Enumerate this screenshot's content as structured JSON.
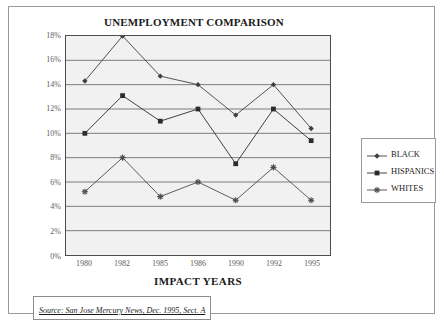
{
  "chart_data": {
    "type": "line",
    "title": "UNEMPLOYMENT COMPARISON",
    "xlabel": "IMPACT YEARS",
    "ylabel": "",
    "categories": [
      "1980",
      "1982",
      "1985",
      "1986",
      "1990",
      "1992",
      "1995"
    ],
    "ylim": [
      0,
      18
    ],
    "ytick_labels": [
      "0%",
      "2%",
      "4%",
      "6%",
      "8%",
      "10%",
      "12%",
      "14%",
      "16%",
      "18%"
    ],
    "ytick_values": [
      0,
      2,
      4,
      6,
      8,
      10,
      12,
      14,
      16,
      18
    ],
    "grid": "horizontal",
    "legend_position": "right",
    "series": [
      {
        "name": "BLACK",
        "marker": "diamond",
        "color": "#3f3f3f",
        "values": [
          14.3,
          18.0,
          14.7,
          14.0,
          11.5,
          14.0,
          10.4
        ]
      },
      {
        "name": "HISPANICS",
        "marker": "square",
        "color": "#2b2b2b",
        "values": [
          10.0,
          13.1,
          11.0,
          12.0,
          7.5,
          12.0,
          9.4
        ]
      },
      {
        "name": "WHITES",
        "marker": "star",
        "color": "#4a4a4a",
        "values": [
          5.2,
          8.0,
          4.8,
          6.0,
          4.5,
          7.2,
          4.5
        ]
      }
    ],
    "annotations": {
      "source": "Source: San Jose Mercury News, Dec. 1995, Sect. A"
    }
  },
  "colors": {
    "plot_background": "#f1f1f1",
    "gridline": "#6e6e6e",
    "axis": "#4d4d4d",
    "frame": "#9a9a9a",
    "text": "#1a1a1a",
    "tick_text": "#5d5d5d"
  }
}
